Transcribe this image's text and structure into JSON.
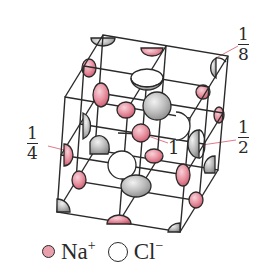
{
  "diagram": {
    "labels": {
      "corner": {
        "numerator": "1",
        "denominator": "8"
      },
      "edge": {
        "numerator": "1",
        "denominator": "4"
      },
      "face": {
        "numerator": "1",
        "denominator": "2"
      },
      "body": "1"
    },
    "legend": [
      {
        "symbol": "Na",
        "charge": "+",
        "color": "#e8a0ac"
      },
      {
        "symbol": "Cl",
        "charge": "−",
        "color": "#ffffff"
      }
    ],
    "colors": {
      "na_fill": "#e8a0ac",
      "na_dark": "#c9586c",
      "cl_fill": "#c8c8c8",
      "cl_dark": "#8a8a8a",
      "line": "#2a2a2a",
      "leader": "#e07a8a"
    }
  }
}
